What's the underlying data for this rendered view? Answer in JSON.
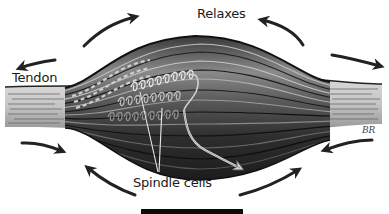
{
  "diagram": {
    "labels": {
      "relaxes": "Relaxes",
      "tendon": "Tendon",
      "spindle_cells": "Spindle cells",
      "artist_signature": "BR"
    },
    "components": [
      {
        "name": "muscle-belly",
        "description": "Spindle-shaped muscle body with horizontal fiber bundles"
      },
      {
        "name": "left-tendon",
        "description": "Light gray striated tendon on left end"
      },
      {
        "name": "right-tendon",
        "description": "Light gray striated tendon on right end"
      },
      {
        "name": "spindle-cells",
        "description": "Coiled nerve endings wrapped around fibers, with nerve fiber exiting lower right"
      }
    ],
    "arrows": [
      {
        "position": "top-left",
        "direction": "up-right (outward)"
      },
      {
        "position": "top-middle-left",
        "direction": "left (outward)"
      },
      {
        "position": "top-right",
        "direction": "up-left (outward)"
      },
      {
        "position": "right",
        "direction": "right (outward)"
      },
      {
        "position": "bottom-left",
        "direction": "right (inward)"
      },
      {
        "position": "bottom-middle-left",
        "direction": "up-left"
      },
      {
        "position": "bottom-middle-right",
        "direction": "up-right"
      },
      {
        "position": "bottom-right",
        "direction": "left (inward)"
      }
    ],
    "colors": {
      "background": "#ffffff",
      "muscle_dark": "#2a2a2a",
      "muscle_mid": "#6a6a6a",
      "muscle_light": "#a8a8a8",
      "tendon": "#cfcfcf",
      "arrow": "#222222"
    }
  }
}
